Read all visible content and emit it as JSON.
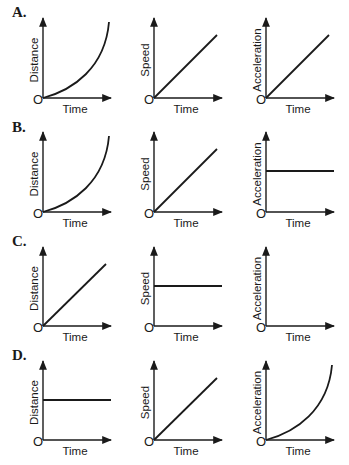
{
  "colors": {
    "ink": "#1a1a1a",
    "background": "#ffffff"
  },
  "axis_labels": {
    "x": "Time",
    "origin": "O"
  },
  "columns": [
    {
      "ylabel": "Distance",
      "axis_x": 43
    },
    {
      "ylabel": "Speed",
      "axis_x": 154
    },
    {
      "ylabel": "Acceleration",
      "axis_x": 266
    }
  ],
  "rows": [
    {
      "label": "A.",
      "top": 18,
      "origin_y": 98,
      "graphs": [
        "curve-up",
        "linear",
        "linear"
      ]
    },
    {
      "label": "B.",
      "top": 132,
      "origin_y": 212,
      "graphs": [
        "curve-up",
        "linear",
        "constant"
      ]
    },
    {
      "label": "C.",
      "top": 247,
      "origin_y": 326,
      "graphs": [
        "linear",
        "constant",
        "zero"
      ]
    },
    {
      "label": "D.",
      "top": 361,
      "origin_y": 440,
      "graphs": [
        "constant",
        "linear",
        "curve-up"
      ]
    }
  ],
  "chart_data": [
    {
      "type": "line",
      "panel": "A",
      "series": [
        {
          "name": "Distance",
          "shape": "increasing curve (accelerating)",
          "x": [
            0,
            0.25,
            0.5,
            0.75,
            1
          ],
          "values": [
            0,
            0.08,
            0.22,
            0.48,
            1
          ]
        },
        {
          "name": "Speed",
          "shape": "straight line through origin",
          "x": [
            0,
            1
          ],
          "values": [
            0,
            0.8
          ]
        },
        {
          "name": "Acceleration",
          "shape": "straight line through origin",
          "x": [
            0,
            1
          ],
          "values": [
            0,
            0.8
          ]
        }
      ],
      "xlabel": "Time"
    },
    {
      "type": "line",
      "panel": "B",
      "series": [
        {
          "name": "Distance",
          "shape": "increasing curve (accelerating)",
          "x": [
            0,
            0.25,
            0.5,
            0.75,
            1
          ],
          "values": [
            0,
            0.08,
            0.22,
            0.48,
            1
          ]
        },
        {
          "name": "Speed",
          "shape": "straight line through origin",
          "x": [
            0,
            1
          ],
          "values": [
            0,
            0.8
          ]
        },
        {
          "name": "Acceleration",
          "shape": "constant horizontal line",
          "x": [
            0,
            1
          ],
          "values": [
            0.5,
            0.5
          ]
        }
      ],
      "xlabel": "Time"
    },
    {
      "type": "line",
      "panel": "C",
      "series": [
        {
          "name": "Distance",
          "shape": "straight line through origin",
          "x": [
            0,
            1
          ],
          "values": [
            0,
            0.8
          ]
        },
        {
          "name": "Speed",
          "shape": "constant horizontal line",
          "x": [
            0,
            1
          ],
          "values": [
            0.5,
            0.5
          ]
        },
        {
          "name": "Acceleration",
          "shape": "zero (along time axis)",
          "x": [
            0,
            1
          ],
          "values": [
            0,
            0
          ]
        }
      ],
      "xlabel": "Time"
    },
    {
      "type": "line",
      "panel": "D",
      "series": [
        {
          "name": "Distance",
          "shape": "constant horizontal line",
          "x": [
            0,
            1
          ],
          "values": [
            0.5,
            0.5
          ]
        },
        {
          "name": "Speed",
          "shape": "straight line through origin",
          "x": [
            0,
            1
          ],
          "values": [
            0,
            0.8
          ]
        },
        {
          "name": "Acceleration",
          "shape": "increasing curve",
          "x": [
            0,
            0.25,
            0.5,
            0.75,
            1
          ],
          "values": [
            0,
            0.08,
            0.22,
            0.48,
            1
          ]
        }
      ],
      "xlabel": "Time"
    }
  ]
}
